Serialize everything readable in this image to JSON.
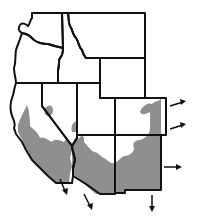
{
  "map": {
    "title": "Western United States species range map",
    "region": "Western United States",
    "states": [
      {
        "id": "washington",
        "label": "Washington"
      },
      {
        "id": "oregon",
        "label": "Oregon"
      },
      {
        "id": "california",
        "label": "California"
      },
      {
        "id": "idaho",
        "label": "Idaho"
      },
      {
        "id": "nevada",
        "label": "Nevada"
      },
      {
        "id": "montana",
        "label": "Montana"
      },
      {
        "id": "wyoming",
        "label": "Wyoming"
      },
      {
        "id": "utah",
        "label": "Utah"
      },
      {
        "id": "colorado",
        "label": "Colorado"
      },
      {
        "id": "arizona",
        "label": "Arizona"
      },
      {
        "id": "new-mexico",
        "label": "New Mexico"
      }
    ],
    "range_shading": {
      "color": "#8f8f8f",
      "description": "Shaded distribution range across southern California, southern Nevada, Arizona, New Mexico and southern Colorado"
    },
    "range_extension_arrows": [
      {
        "direction": "east",
        "location": "northeast Colorado"
      },
      {
        "direction": "east",
        "location": "southeast Colorado"
      },
      {
        "direction": "east",
        "location": "eastern New Mexico"
      },
      {
        "direction": "south",
        "location": "southern New Mexico"
      },
      {
        "direction": "south",
        "location": "southern California coast"
      },
      {
        "direction": "south",
        "location": "Baja California border"
      }
    ],
    "colors": {
      "border": "#111111",
      "background": "#ffffff",
      "range": "#8f8f8f"
    }
  }
}
